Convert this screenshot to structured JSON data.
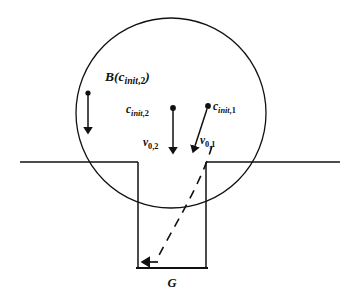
{
  "figure": {
    "colors": {
      "ink": "#111111",
      "background": "#ffffff"
    },
    "labels": {
      "ball_region": {
        "base": "B(c",
        "sub": "init",
        "sub_tail": ",2",
        "close": ")",
        "full": "B(c_init,2)"
      },
      "center_2": {
        "base": "c",
        "sub": "init",
        "sub_tail": ",2",
        "full": "c_init,2"
      },
      "center_1": {
        "base": "c",
        "sub": "init",
        "sub_tail": ",1",
        "full": "c_init,1"
      },
      "velocity_2": {
        "base": "v",
        "sub": "0,2",
        "full": "v_0,2"
      },
      "velocity_1": {
        "base": "v",
        "sub": "0,1",
        "full": "v_0,1"
      },
      "groove": {
        "base": "G",
        "full": "G"
      }
    },
    "geometry": {
      "circle": {
        "cx": 171,
        "cy": 113,
        "r": 95
      },
      "surface_line": {
        "y": 162,
        "x_left_start": 20,
        "x_left_end": 138,
        "x_right_start": 206,
        "x_right_end": 340
      },
      "groove": {
        "left_wall_x": 138,
        "right_wall_x": 206,
        "bottom_y": 268,
        "top_y": 162
      },
      "radius_arrow": {
        "x": 88,
        "y_top": 93,
        "y_bottom": 133
      },
      "velocity_arrow_2": {
        "x1": 173,
        "y1": 108,
        "x2": 173,
        "y2": 153
      },
      "velocity_arrow_1": {
        "x1": 208,
        "y1": 107,
        "x2": 193,
        "y2": 153
      },
      "trajectory": {
        "start_x": 212,
        "start_y": 148,
        "end_x": 152,
        "end_y": 262
      }
    }
  }
}
